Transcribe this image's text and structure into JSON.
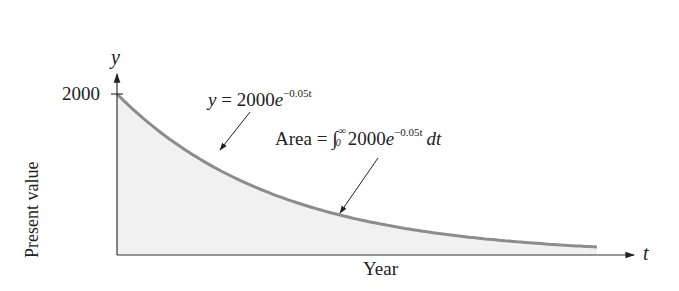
{
  "chart_data": {
    "type": "area",
    "title": "",
    "xlabel": "Year",
    "ylabel": "Present value",
    "x_axis_symbol": "t",
    "y_axis_symbol": "y",
    "y_ticks": [
      {
        "value": 2000,
        "label": "2000"
      }
    ],
    "x_ticks": [],
    "function": "y = 2000e^(-0.05t)",
    "series": [
      {
        "name": "y = 2000e^{-0.05t}",
        "x": [
          0,
          5,
          10,
          15,
          20,
          25,
          30,
          35,
          40,
          45,
          50,
          55,
          60
        ],
        "values": [
          2000,
          1558,
          1213,
          945,
          736,
          573,
          446,
          348,
          271,
          211,
          164,
          128,
          100
        ]
      }
    ],
    "annotations": [
      {
        "text": "y = 2000e^{-0.05t}",
        "points_to": "curve"
      },
      {
        "text": "Area = ∫₀^∞ 2000e^{-0.05t} dt",
        "points_to": "shaded region under curve"
      }
    ],
    "shaded_region": "area under curve from t=0 to ∞",
    "grid": false,
    "legend": "none",
    "colors": {
      "curve": "#8c8c8c",
      "fill": "#f1f1f1",
      "axes": "#333333"
    }
  },
  "labels": {
    "y_symbol": "y",
    "t_symbol": "t",
    "y_tick": "2000",
    "ylabel": "Present value",
    "xlabel": "Year",
    "curve_eq": {
      "lhs": "y",
      "eq": " = 2000",
      "e": "e",
      "exp": "−0.05t"
    },
    "area_eq": {
      "word": "Area",
      "eq": " = ",
      "integral": "∫",
      "upper": "∞",
      "lower": "0",
      "coef": "2000",
      "e": "e",
      "exp": "−0.05t",
      "dt": "dt"
    }
  }
}
